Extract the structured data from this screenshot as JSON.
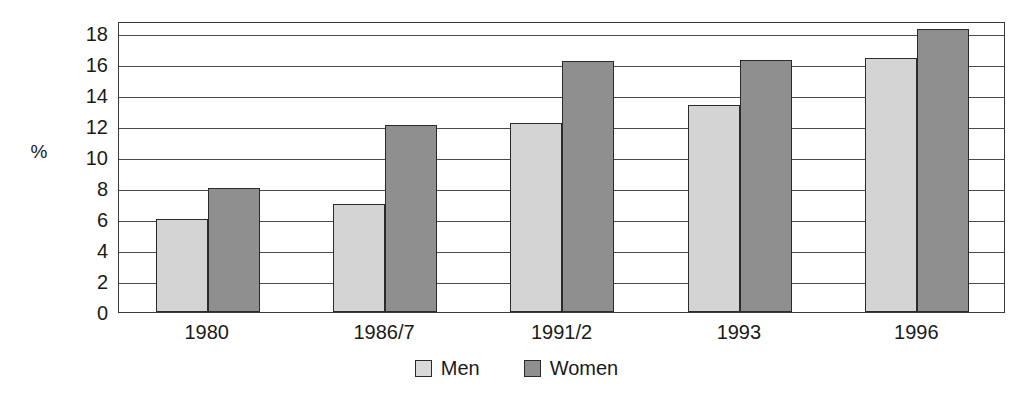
{
  "chart_data": {
    "type": "bar",
    "title": "",
    "subtitle": "",
    "xlabel": "",
    "ylabel": "%",
    "categories": [
      "1980",
      "1986/7",
      "1991/2",
      "1993",
      "1996"
    ],
    "series": [
      {
        "name": "Men",
        "color": "#d4d4d4",
        "values": [
          6.0,
          7.0,
          12.2,
          13.4,
          16.4
        ]
      },
      {
        "name": "Women",
        "color": "#8f8f8f",
        "values": [
          8.0,
          12.1,
          16.2,
          16.3,
          18.3
        ]
      }
    ],
    "ylim": [
      0,
      18.8
    ],
    "y_ticks": [
      0,
      2,
      4,
      6,
      8,
      10,
      12,
      14,
      16,
      18
    ],
    "y_tick_labels": [
      "0",
      "2",
      "4",
      "6",
      "8",
      "10",
      "12",
      "14",
      "16",
      "18"
    ],
    "grid": true,
    "grid_axis": "y",
    "legend_position": "bottom-center",
    "legend_entries": [
      "Men",
      "Women"
    ],
    "annotations": []
  },
  "legend": {
    "items": [
      {
        "label": "Men",
        "swatch": "legend-swatch-men"
      },
      {
        "label": "Women",
        "swatch": "legend-swatch-women"
      }
    ]
  },
  "colors": {
    "men": "#d4d4d4",
    "women": "#8f8f8f",
    "axis": "#3a3a3a",
    "grid": "#4a4a4a",
    "text": "#1a1a1a",
    "background": "#ffffff"
  }
}
